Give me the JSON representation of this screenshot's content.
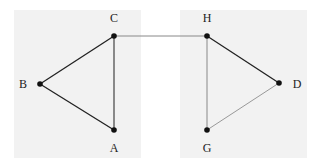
{
  "diagram": {
    "type": "graph",
    "panels": [
      {
        "id": "left",
        "x": 14,
        "y": 10,
        "w": 127,
        "h": 148,
        "fill": "#f2f2f2"
      },
      {
        "id": "right",
        "x": 180,
        "y": 10,
        "w": 127,
        "h": 148,
        "fill": "#f2f2f2"
      }
    ],
    "nodes": [
      {
        "id": "C",
        "label": "C",
        "x": 114,
        "y": 36,
        "lx": 114,
        "ly": 22
      },
      {
        "id": "B",
        "label": "B",
        "x": 40,
        "y": 84,
        "lx": 23,
        "ly": 88
      },
      {
        "id": "A",
        "label": "A",
        "x": 114,
        "y": 130,
        "lx": 114,
        "ly": 152
      },
      {
        "id": "H",
        "label": "H",
        "x": 207,
        "y": 36,
        "lx": 207,
        "ly": 22
      },
      {
        "id": "D",
        "label": "D",
        "x": 279,
        "y": 83,
        "lx": 297,
        "ly": 88
      },
      {
        "id": "G",
        "label": "G",
        "x": 207,
        "y": 130,
        "lx": 207,
        "ly": 152
      }
    ],
    "edges": [
      {
        "from": "C",
        "to": "B",
        "color": "#222222",
        "width": 1.3
      },
      {
        "from": "B",
        "to": "A",
        "color": "#222222",
        "width": 1.3
      },
      {
        "from": "C",
        "to": "A",
        "color": "#333333",
        "width": 1.1
      },
      {
        "from": "C",
        "to": "H",
        "color": "#888888",
        "width": 1.0
      },
      {
        "from": "H",
        "to": "D",
        "color": "#222222",
        "width": 1.3
      },
      {
        "from": "H",
        "to": "G",
        "color": "#888888",
        "width": 1.0
      },
      {
        "from": "G",
        "to": "D",
        "color": "#999999",
        "width": 1.0
      }
    ]
  }
}
